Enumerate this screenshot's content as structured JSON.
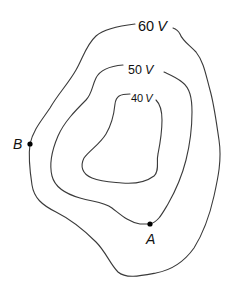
{
  "diagram": {
    "type": "equipotential-lines",
    "line_color": "#3a3a3a",
    "text_color": "#111111",
    "contours": [
      {
        "id": "outer",
        "value": "60",
        "unit": "V",
        "label": "60 V"
      },
      {
        "id": "middle",
        "value": "50",
        "unit": "V",
        "label": "50 V"
      },
      {
        "id": "inner",
        "value": "40",
        "unit": "V",
        "label": "40 V"
      }
    ],
    "points": [
      {
        "id": "B",
        "label": "B",
        "on_contour": "60 V"
      },
      {
        "id": "A",
        "label": "A",
        "on_contour": "50 V"
      }
    ]
  }
}
